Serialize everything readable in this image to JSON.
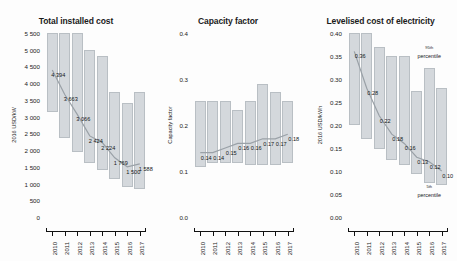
{
  "figure": {
    "panels": [
      "total_installed_cost",
      "capacity_factor",
      "lcoe"
    ]
  },
  "chart_data": [
    {
      "type": "bar",
      "title": "Total installed cost",
      "ylabel": "2016 USD/kW",
      "xlabel": "",
      "categories": [
        "2010",
        "2011",
        "2012",
        "2013",
        "2014",
        "2015",
        "2016",
        "2017"
      ],
      "ylim": [
        0,
        5500
      ],
      "yticks": [
        "0",
        "500",
        "1 000",
        "1 500",
        "2 000",
        "2 500",
        "3 000",
        "3 500",
        "4 000",
        "4 500",
        "5 000",
        "5 500"
      ],
      "ytick_values": [
        0,
        500,
        1000,
        1500,
        2000,
        2500,
        3000,
        3500,
        4000,
        4500,
        5000,
        5500
      ],
      "grid": false,
      "legend": "",
      "series": [
        {
          "name": "5th percentile",
          "values": [
            3150,
            2350,
            1950,
            1600,
            1400,
            1150,
            900,
            850
          ]
        },
        {
          "name": "95th percentile",
          "values": [
            5500,
            5500,
            5500,
            5000,
            4820,
            3750,
            3400,
            3750
          ]
        },
        {
          "name": "Weighted average",
          "values": [
            4394,
            3663,
            3066,
            2424,
            2224,
            1769,
            1500,
            1588
          ]
        }
      ],
      "data_labels": [
        "4 394",
        "3 663",
        "3 066",
        "2 424",
        "2 224",
        "1 769",
        "1 500",
        "1 588"
      ]
    },
    {
      "type": "bar",
      "title": "Capacity factor",
      "ylabel": "Capacity factor",
      "xlabel": "",
      "categories": [
        "2010",
        "2011",
        "2012",
        "2013",
        "2014",
        "2015",
        "2016",
        "2017"
      ],
      "ylim": [
        0.0,
        0.4
      ],
      "yticks": [
        "0.0",
        "0.1",
        "0.2",
        "0.3",
        "0.4"
      ],
      "ytick_values": [
        0.0,
        0.1,
        0.2,
        0.3,
        0.4
      ],
      "grid": false,
      "legend": "",
      "series": [
        {
          "name": "5th percentile",
          "values": [
            0.108,
            0.118,
            0.118,
            0.118,
            0.114,
            0.114,
            0.114,
            0.118
          ]
        },
        {
          "name": "95th percentile",
          "values": [
            0.252,
            0.252,
            0.252,
            0.233,
            0.252,
            0.29,
            0.272,
            0.252
          ]
        },
        {
          "name": "Weighted average",
          "values": [
            0.14,
            0.14,
            0.15,
            0.16,
            0.16,
            0.17,
            0.17,
            0.18
          ]
        }
      ],
      "data_labels": [
        "0.14",
        "0.14",
        "0.15",
        "0.16",
        "0.16",
        "0.17",
        "0.17",
        "0.18"
      ]
    },
    {
      "type": "bar",
      "title": "Levelised cost of electricity",
      "ylabel": "2016 USD/kWh",
      "xlabel": "",
      "categories": [
        "2010",
        "2011",
        "2012",
        "2013",
        "2014",
        "2015",
        "2016",
        "2017"
      ],
      "ylim": [
        0.0,
        0.4
      ],
      "yticks": [
        "0.00",
        "0.05",
        "0.10",
        "0.15",
        "0.20",
        "0.25",
        "0.30",
        "0.35",
        "0.40"
      ],
      "ytick_values": [
        0.0,
        0.05,
        0.1,
        0.15,
        0.2,
        0.25,
        0.3,
        0.35,
        0.4
      ],
      "grid": false,
      "legend": "",
      "series": [
        {
          "name": "5th percentile",
          "values": [
            0.2,
            0.17,
            0.148,
            0.125,
            0.112,
            0.093,
            0.074,
            0.07
          ]
        },
        {
          "name": "95th percentile",
          "values": [
            0.4,
            0.4,
            0.37,
            0.35,
            0.35,
            0.275,
            0.325,
            0.28
          ]
        },
        {
          "name": "Weighted average",
          "values": [
            0.36,
            0.28,
            0.22,
            0.18,
            0.16,
            0.13,
            0.12,
            0.1
          ]
        }
      ],
      "data_labels": [
        "0.36",
        "0.28",
        "0.22",
        "0.18",
        "0.16",
        "0.13",
        "0.12",
        "0.10"
      ],
      "annotations": [
        {
          "name": "upper-percentile",
          "text_sup": "95",
          "text_rest": "th",
          "line2": "percentile"
        },
        {
          "name": "lower-percentile",
          "text_sup": "5",
          "text_rest": "th",
          "line2": "percentile"
        }
      ]
    }
  ]
}
